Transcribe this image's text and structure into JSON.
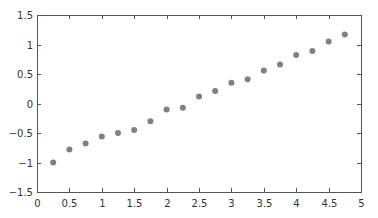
{
  "chart_data": {
    "type": "scatter",
    "title": "",
    "xlabel": "",
    "ylabel": "",
    "xlim": [
      0,
      5
    ],
    "ylim": [
      -1.5,
      1.5
    ],
    "grid": false,
    "legend": null,
    "x_ticks": [
      "0",
      "0.5",
      "1",
      "1.5",
      "2",
      "2.5",
      "3",
      "3.5",
      "4",
      "4.5",
      "5"
    ],
    "y_ticks": [
      "1.5",
      "1",
      "0.5",
      "0",
      "-0.5",
      "-1",
      "-1.5"
    ],
    "series": [
      {
        "name": "data",
        "marker": "circle",
        "color": "#808080",
        "x": [
          0.25,
          0.5,
          0.75,
          1.0,
          1.25,
          1.5,
          1.75,
          2.0,
          2.25,
          2.5,
          2.75,
          3.0,
          3.25,
          3.5,
          3.75,
          4.0,
          4.25,
          4.5,
          4.75
        ],
        "y": [
          -1.0,
          -0.78,
          -0.68,
          -0.56,
          -0.5,
          -0.45,
          -0.3,
          -0.1,
          -0.07,
          0.12,
          0.21,
          0.35,
          0.41,
          0.56,
          0.66,
          0.82,
          0.89,
          1.05,
          1.17
        ]
      }
    ]
  },
  "style": {
    "axis_color": "#555555",
    "point_color": "#808080",
    "point_radius": 3
  },
  "layout": {
    "plot_left": 37,
    "plot_top": 15,
    "plot_right": 361,
    "plot_bottom": 192
  }
}
